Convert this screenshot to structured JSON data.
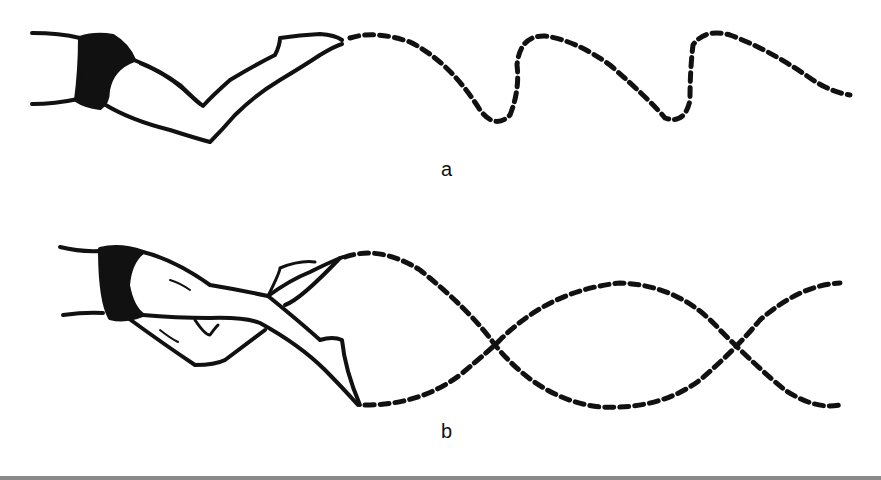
{
  "figure": {
    "panels": [
      {
        "id": "a",
        "label": "a",
        "trajectory": "sinusoidal dashed path of single foot (flutter kick)"
      },
      {
        "id": "b",
        "label": "b",
        "trajectory": "two crossing dashed paths of both feet"
      }
    ],
    "colors": {
      "ink": "#111111",
      "background": "#ffffff",
      "rule": "#8a8a8a"
    }
  }
}
